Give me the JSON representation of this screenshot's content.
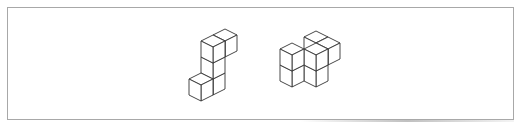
{
  "diagram": {
    "stroke_color": "#333333",
    "fill_color": "#ffffff",
    "frame_color": "#a8a8a8",
    "figures": [
      {
        "name": "figure-1",
        "origin": [
          213,
          83
        ],
        "cube_count": 5,
        "cubes": [
          [
            0,
            0,
            0
          ],
          [
            0,
            0,
            1
          ],
          [
            0,
            0,
            2
          ],
          [
            0,
            -1,
            2
          ],
          [
            0,
            1,
            0
          ]
        ]
      },
      {
        "name": "figure-2",
        "origin": [
          316,
          75
        ],
        "cube_count": 5,
        "cubes": [
          [
            0,
            0,
            0
          ],
          [
            0,
            0,
            1
          ],
          [
            -1,
            -1,
            1
          ],
          [
            0,
            -1,
            1
          ],
          [
            -1,
            1,
            0
          ],
          [
            -1,
            1,
            1
          ]
        ]
      }
    ],
    "unit": {
      "x": [
        12,
        6
      ],
      "y": [
        -12,
        6
      ],
      "z": [
        0,
        -16
      ]
    }
  }
}
